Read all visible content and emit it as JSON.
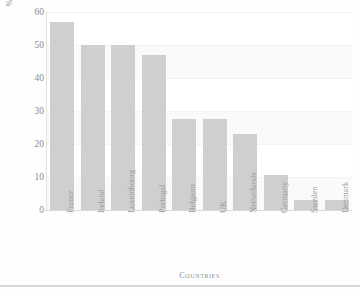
{
  "chart_data": {
    "type": "bar",
    "title": "",
    "xlabel": "Countries",
    "ylabel": "% Exceeding Agreed Credit Terms",
    "categories": [
      "France",
      "Ireland",
      "Luxembourg",
      "Portugal",
      "Belgium",
      "UK",
      "Netherlands",
      "Germany",
      "Sweden",
      "Denmark"
    ],
    "values": [
      57,
      50,
      50,
      47,
      27.5,
      27.5,
      23,
      10.5,
      3,
      3
    ],
    "ylim": [
      0,
      60
    ],
    "yticks": [
      0,
      10,
      20,
      30,
      40,
      50,
      60
    ],
    "ytick_labels": [
      "0",
      "10",
      "20",
      "30",
      "40",
      "50",
      "60"
    ],
    "grid": true,
    "legend": false,
    "legend_position": "none",
    "bar_color": "#cfcfcf",
    "axis_color": "#d9d9d9",
    "text_color": "#8d8d8d",
    "background_color": "#ffffff"
  },
  "axis": {
    "y_title": "% Exceeding Agreed Credit Terms",
    "x_title": "Countries"
  }
}
